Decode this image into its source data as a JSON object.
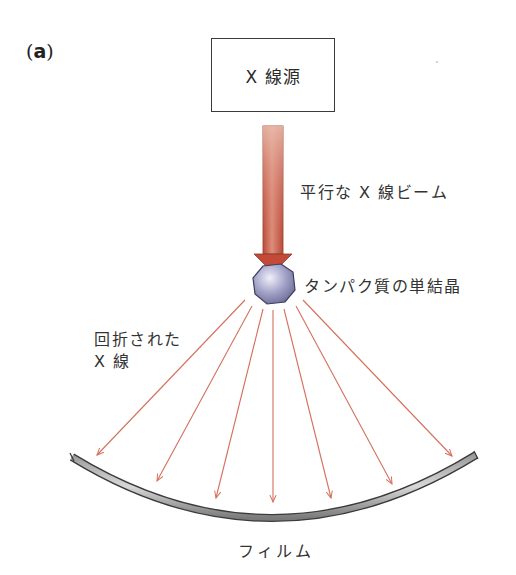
{
  "panel": {
    "label_open": "(",
    "label_letter": "a",
    "label_close": ")"
  },
  "source": {
    "label": "X 線源"
  },
  "beam": {
    "label": "平行な X 線ビーム",
    "color": "#c8503c"
  },
  "crystal": {
    "label": "タンパク質の単結晶",
    "color": "#8a8ab8"
  },
  "diffracted": {
    "line1": "回折された",
    "line2": "X 線",
    "ray_color": "#d4705c",
    "ray_count": 7
  },
  "film": {
    "label": "フィルム",
    "color": "#6e6e6e"
  }
}
